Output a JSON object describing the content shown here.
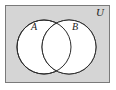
{
  "figure": {
    "type": "venn-diagram",
    "title": "",
    "universe": {
      "label": "U",
      "name": "universal-set",
      "fill_color": "#d5d5d5",
      "stroke_color": "#7a7a7a",
      "rect": {
        "x": 5,
        "y": 5,
        "width": 105,
        "height": 78
      }
    },
    "sets": [
      {
        "label": "A",
        "name": "set-a",
        "fill_color": "#ffffff",
        "stroke_color": "#2b2b2b",
        "center_x": 44,
        "center_y": 47,
        "radius": 27,
        "label_x": 34,
        "label_y": 30
      },
      {
        "label": "B",
        "name": "set-b",
        "fill_color": "#ffffff",
        "stroke_color": "#2b2b2b",
        "center_x": 69,
        "center_y": 47,
        "radius": 27,
        "label_x": 75,
        "label_y": 30
      }
    ],
    "intersection": {
      "name": "intersection-region",
      "shaded": false,
      "fill_color": "#ffffff"
    },
    "universe_label_position": {
      "x": 100,
      "y": 16
    }
  }
}
